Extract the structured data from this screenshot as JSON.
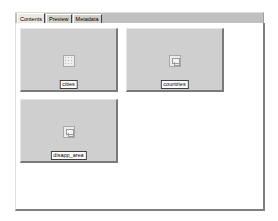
{
  "tabs": [
    {
      "label": "Contents",
      "active": true
    },
    {
      "label": "Preview",
      "active": false
    },
    {
      "label": "Metadata",
      "active": false
    }
  ],
  "contents": {
    "items": [
      {
        "label": "cities",
        "icon": "point-dataset-icon"
      },
      {
        "label": "countries",
        "icon": "polygon-dataset-icon"
      },
      {
        "label": "disapp_area",
        "icon": "polygon-dataset-icon"
      }
    ]
  },
  "colors": {
    "tile_background": "#cfcfcf",
    "tab_strip": "#c0c0c0",
    "panel_background": "#ffffff"
  }
}
